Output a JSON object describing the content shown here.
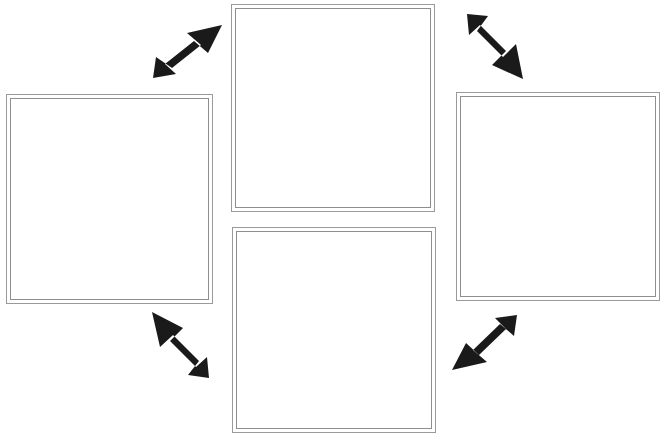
{
  "diagram": {
    "type": "cycle-diagram",
    "title": "",
    "background_color": "#ffffff",
    "box_border_color": "#9a9a9a",
    "arrow_color": "#1a1a1a",
    "box_count": 4,
    "arrow_count": 4,
    "boxes": [
      {
        "id": "top",
        "label": "",
        "position": "top-center",
        "x": 231,
        "y": 4,
        "width": 204,
        "height": 208
      },
      {
        "id": "right",
        "label": "",
        "position": "middle-right",
        "x": 456,
        "y": 92,
        "width": 204,
        "height": 209
      },
      {
        "id": "bottom",
        "label": "",
        "position": "bottom-center",
        "x": 232,
        "y": 227,
        "width": 204,
        "height": 206
      },
      {
        "id": "left",
        "label": "",
        "position": "middle-left",
        "x": 6,
        "y": 94,
        "width": 207,
        "height": 210
      }
    ],
    "arrows": [
      {
        "id": "left-to-top",
        "direction": "northeast",
        "from": "left",
        "to": "top",
        "label": "",
        "x": 153,
        "y": 25,
        "width": 70,
        "height": 54
      },
      {
        "id": "top-to-right",
        "direction": "southeast",
        "from": "top",
        "to": "right",
        "label": "",
        "x": 452,
        "y": 28,
        "width": 71,
        "height": 51
      },
      {
        "id": "right-to-bottom",
        "direction": "southwest",
        "from": "right",
        "to": "bottom",
        "label": "",
        "x": 452,
        "y": 319,
        "width": 71,
        "height": 51
      },
      {
        "id": "bottom-to-left",
        "direction": "northwest",
        "from": "bottom",
        "to": "left",
        "label": "",
        "x": 152,
        "y": 312,
        "width": 71,
        "height": 52
      }
    ]
  }
}
